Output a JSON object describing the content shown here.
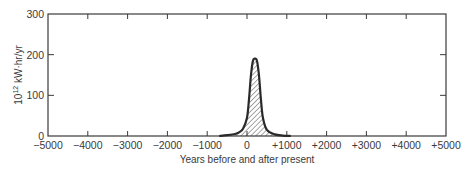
{
  "chart_data": {
    "type": "area",
    "title": "",
    "xlabel": "Years before and after present",
    "ylabel": "10^12 kW·hr/yr",
    "ylabel_parts": {
      "base": "10",
      "exp": "12",
      "unit": " kW·hr/yr"
    },
    "xlim": [
      -5000,
      5000
    ],
    "ylim": [
      0,
      300
    ],
    "grid": false,
    "legend": null,
    "x_ticks": [
      -5000,
      -4000,
      -3000,
      -2000,
      -1000,
      0,
      1000,
      2000,
      3000,
      4000,
      5000
    ],
    "x_tick_labels": [
      "−5000",
      "−4000",
      "−3000",
      "−2000",
      "−1000",
      "0",
      "+1000",
      "+2000",
      "+3000",
      "+4000",
      "+5000"
    ],
    "y_ticks": [
      0,
      100,
      200,
      300
    ],
    "y_tick_labels": [
      "0",
      "100",
      "200",
      "300"
    ],
    "series": [
      {
        "name": "Fossil fuel production rate",
        "fill": "hatched",
        "x": [
          -700,
          -500,
          -300,
          -200,
          -100,
          0,
          50,
          100,
          150,
          200,
          250,
          300,
          350,
          400,
          500,
          700,
          900,
          1100
        ],
        "y": [
          0,
          2,
          5,
          9,
          18,
          45,
          90,
          150,
          185,
          190,
          185,
          150,
          90,
          45,
          15,
          4,
          1,
          0
        ]
      }
    ]
  },
  "colors": {
    "line": "#2a2a2a",
    "axis": "#3a3a3a",
    "hatch": "#3a3a3a",
    "background": "#ffffff"
  }
}
